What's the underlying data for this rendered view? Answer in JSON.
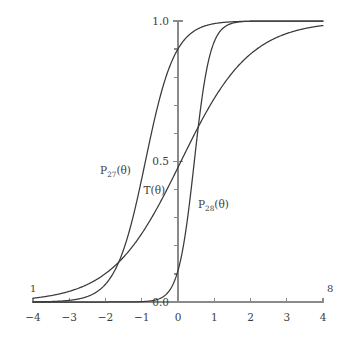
{
  "chart_data": {
    "type": "line",
    "title": "",
    "xlabel": "",
    "ylabel": "",
    "xlim": [
      -4,
      4
    ],
    "ylim": [
      0.0,
      1.0
    ],
    "grid": false,
    "legend": "inline-annotations",
    "x_ticks": [
      "-4",
      "-3",
      "-2",
      "-1",
      "0",
      "1",
      "2",
      "3",
      "4"
    ],
    "x_tick_values": [
      -4,
      -3,
      -2,
      -1,
      0,
      1,
      2,
      3,
      4
    ],
    "y_ticks": [
      "0.0",
      "0.5",
      "1.0"
    ],
    "y_tick_values": [
      0.0,
      0.5,
      1.0
    ],
    "y_minor_tick_values": [
      0.1,
      0.2,
      0.3,
      0.4,
      0.6,
      0.7,
      0.8,
      0.9
    ],
    "x_axis_start_label": "1",
    "x_axis_end_label": "8",
    "series": [
      {
        "name": "P_27(theta)",
        "label_main": "P",
        "label_sub": "27",
        "label_tail": "(θ)",
        "model": "logistic",
        "difficulty": -0.9,
        "discrimination": 2.45,
        "lower_asymptote": 0.0,
        "x": [
          -4,
          -3.5,
          -3,
          -2.5,
          -2,
          -1.5,
          -1.25,
          -1,
          -0.75,
          -0.5,
          -0.25,
          0,
          0.5,
          1,
          1.5,
          2,
          2.5,
          3,
          3.5,
          4
        ],
        "y": [
          0.0006,
          0.0019,
          0.0065,
          0.0218,
          0.0707,
          0.2058,
          0.3136,
          0.4388,
          0.5704,
          0.6922,
          0.7925,
          0.8669,
          0.9503,
          0.9846,
          0.9954,
          0.9986,
          0.9996,
          0.9999,
          1.0,
          1.0
        ]
      },
      {
        "name": "T(theta)",
        "label_main": "T",
        "label_sub": "",
        "label_tail": "(θ)",
        "model": "logistic",
        "difficulty": 0.08,
        "discrimination": 1.05,
        "lower_asymptote": 0.0,
        "x": [
          -4,
          -3.5,
          -3,
          -2.5,
          -2,
          -1.5,
          -1,
          -0.5,
          0,
          0.5,
          1,
          1.5,
          2,
          2.5,
          3,
          3.5,
          4
        ],
        "y": [
          0.0136,
          0.0228,
          0.038,
          0.0627,
          0.1018,
          0.1617,
          0.2476,
          0.3572,
          0.479,
          0.601,
          0.7091,
          0.7953,
          0.8586,
          0.9028,
          0.9331,
          0.9537,
          0.9676
        ]
      },
      {
        "name": "P_28(theta)",
        "label_main": "P",
        "label_sub": "28",
        "label_tail": "(θ)",
        "model": "logistic",
        "difficulty": 0.45,
        "discrimination": 4.6,
        "lower_asymptote": 0.0,
        "x": [
          -4,
          -3,
          -2,
          -1.5,
          -1,
          -0.5,
          -0.25,
          0,
          0.25,
          0.5,
          0.75,
          1,
          1.25,
          1.5,
          2,
          2.5,
          3,
          3.5,
          4
        ],
        "y": [
          0.0,
          0.0,
          0.0,
          0.0,
          0.0013,
          0.0131,
          0.0405,
          0.1128,
          0.2466,
          0.4424,
          0.6511,
          0.8097,
          0.9051,
          0.9556,
          0.9911,
          0.9989,
          0.9999,
          1.0,
          1.0
        ]
      }
    ],
    "annotations": [
      {
        "text": "P",
        "sub": "27",
        "tail": "(θ)",
        "x_data": -2.15,
        "y_data": 0.455
      },
      {
        "text": "T",
        "sub": "",
        "tail": "(θ)",
        "x_data": -0.95,
        "y_data": 0.385
      },
      {
        "text": "P",
        "sub": "28",
        "tail": "(θ)",
        "x_data": 0.55,
        "y_data": 0.335
      }
    ]
  }
}
